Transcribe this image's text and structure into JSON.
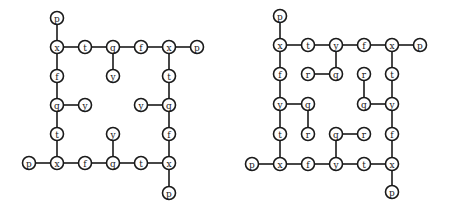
{
  "diagrams": [
    {
      "name": "left-graph",
      "nodes": [
        {
          "id": "a1",
          "label": "p",
          "x": 57,
          "y": 18
        },
        {
          "id": "a2",
          "label": "x",
          "x": 57,
          "y": 47
        },
        {
          "id": "a3",
          "label": "t",
          "x": 85,
          "y": 47
        },
        {
          "id": "a4",
          "label": "q",
          "x": 113,
          "y": 47
        },
        {
          "id": "a5",
          "label": "f",
          "x": 141,
          "y": 47
        },
        {
          "id": "a6",
          "label": "x",
          "x": 169,
          "y": 47
        },
        {
          "id": "a7",
          "label": "p",
          "x": 197,
          "y": 47
        },
        {
          "id": "a8",
          "label": "y",
          "x": 113,
          "y": 76
        },
        {
          "id": "a9",
          "label": "f",
          "x": 57,
          "y": 76
        },
        {
          "id": "a10",
          "label": "t",
          "x": 169,
          "y": 76
        },
        {
          "id": "a11",
          "label": "q",
          "x": 57,
          "y": 105
        },
        {
          "id": "a12",
          "label": "y",
          "x": 85,
          "y": 105
        },
        {
          "id": "a13",
          "label": "y",
          "x": 141,
          "y": 105
        },
        {
          "id": "a14",
          "label": "q",
          "x": 169,
          "y": 105
        },
        {
          "id": "a15",
          "label": "t",
          "x": 57,
          "y": 134
        },
        {
          "id": "a16",
          "label": "y",
          "x": 113,
          "y": 134
        },
        {
          "id": "a17",
          "label": "f",
          "x": 169,
          "y": 134
        },
        {
          "id": "a18",
          "label": "p",
          "x": 29,
          "y": 163
        },
        {
          "id": "a19",
          "label": "x",
          "x": 57,
          "y": 163
        },
        {
          "id": "a20",
          "label": "f",
          "x": 85,
          "y": 163
        },
        {
          "id": "a21",
          "label": "q",
          "x": 113,
          "y": 163
        },
        {
          "id": "a22",
          "label": "t",
          "x": 141,
          "y": 163
        },
        {
          "id": "a23",
          "label": "x",
          "x": 169,
          "y": 163
        },
        {
          "id": "a24",
          "label": "p",
          "x": 169,
          "y": 193
        }
      ],
      "edges": [
        [
          "a1",
          "a2"
        ],
        [
          "a2",
          "a3"
        ],
        [
          "a3",
          "a4"
        ],
        [
          "a4",
          "a5"
        ],
        [
          "a5",
          "a6"
        ],
        [
          "a6",
          "a7"
        ],
        [
          "a4",
          "a8"
        ],
        [
          "a2",
          "a9"
        ],
        [
          "a9",
          "a11"
        ],
        [
          "a11",
          "a12"
        ],
        [
          "a11",
          "a15"
        ],
        [
          "a15",
          "a19"
        ],
        [
          "a6",
          "a10"
        ],
        [
          "a10",
          "a14"
        ],
        [
          "a13",
          "a14"
        ],
        [
          "a14",
          "a17"
        ],
        [
          "a17",
          "a23"
        ],
        [
          "a18",
          "a19"
        ],
        [
          "a19",
          "a20"
        ],
        [
          "a20",
          "a21"
        ],
        [
          "a21",
          "a22"
        ],
        [
          "a22",
          "a23"
        ],
        [
          "a16",
          "a21"
        ],
        [
          "a23",
          "a24"
        ]
      ]
    },
    {
      "name": "right-graph",
      "nodes": [
        {
          "id": "b1",
          "label": "p",
          "x": 280,
          "y": 16
        },
        {
          "id": "b2",
          "label": "x",
          "x": 280,
          "y": 45
        },
        {
          "id": "b3",
          "label": "t",
          "x": 308,
          "y": 45
        },
        {
          "id": "b4",
          "label": "y",
          "x": 336,
          "y": 45
        },
        {
          "id": "b5",
          "label": "f",
          "x": 364,
          "y": 45
        },
        {
          "id": "b6",
          "label": "x",
          "x": 392,
          "y": 45
        },
        {
          "id": "b7",
          "label": "p",
          "x": 420,
          "y": 45
        },
        {
          "id": "b8",
          "label": "f",
          "x": 280,
          "y": 74
        },
        {
          "id": "b9",
          "label": "r",
          "x": 308,
          "y": 74
        },
        {
          "id": "b10",
          "label": "q",
          "x": 336,
          "y": 74
        },
        {
          "id": "b11",
          "label": "r",
          "x": 364,
          "y": 74
        },
        {
          "id": "b12",
          "label": "t",
          "x": 392,
          "y": 74
        },
        {
          "id": "b13",
          "label": "y",
          "x": 280,
          "y": 104
        },
        {
          "id": "b14",
          "label": "q",
          "x": 308,
          "y": 104
        },
        {
          "id": "b15",
          "label": "q",
          "x": 364,
          "y": 104
        },
        {
          "id": "b16",
          "label": "y",
          "x": 392,
          "y": 104
        },
        {
          "id": "b17",
          "label": "t",
          "x": 280,
          "y": 134
        },
        {
          "id": "b18",
          "label": "r",
          "x": 308,
          "y": 134
        },
        {
          "id": "b19",
          "label": "q",
          "x": 336,
          "y": 134
        },
        {
          "id": "b20",
          "label": "r",
          "x": 364,
          "y": 134
        },
        {
          "id": "b21",
          "label": "f",
          "x": 392,
          "y": 134
        },
        {
          "id": "b22",
          "label": "p",
          "x": 252,
          "y": 164
        },
        {
          "id": "b23",
          "label": "x",
          "x": 280,
          "y": 164
        },
        {
          "id": "b24",
          "label": "f",
          "x": 308,
          "y": 164
        },
        {
          "id": "b25",
          "label": "y",
          "x": 336,
          "y": 164
        },
        {
          "id": "b26",
          "label": "t",
          "x": 364,
          "y": 164
        },
        {
          "id": "b27",
          "label": "x",
          "x": 392,
          "y": 164
        },
        {
          "id": "b28",
          "label": "p",
          "x": 392,
          "y": 192
        }
      ],
      "edges": [
        [
          "b1",
          "b2"
        ],
        [
          "b2",
          "b3"
        ],
        [
          "b3",
          "b4"
        ],
        [
          "b4",
          "b5"
        ],
        [
          "b5",
          "b6"
        ],
        [
          "b6",
          "b7"
        ],
        [
          "b2",
          "b8"
        ],
        [
          "b8",
          "b13"
        ],
        [
          "b13",
          "b14"
        ],
        [
          "b14",
          "b18"
        ],
        [
          "b13",
          "b17"
        ],
        [
          "b17",
          "b23"
        ],
        [
          "b4",
          "b10"
        ],
        [
          "b9",
          "b10"
        ],
        [
          "b6",
          "b12"
        ],
        [
          "b12",
          "b16"
        ],
        [
          "b15",
          "b16"
        ],
        [
          "b11",
          "b15"
        ],
        [
          "b16",
          "b21"
        ],
        [
          "b21",
          "b27"
        ],
        [
          "b19",
          "b20"
        ],
        [
          "b19",
          "b25"
        ],
        [
          "b22",
          "b23"
        ],
        [
          "b23",
          "b24"
        ],
        [
          "b24",
          "b25"
        ],
        [
          "b25",
          "b26"
        ],
        [
          "b26",
          "b27"
        ],
        [
          "b27",
          "b28"
        ]
      ]
    }
  ],
  "style": {
    "node_radius": 6.5,
    "stroke_color": "#1a1a1a",
    "background": "#ffffff"
  }
}
